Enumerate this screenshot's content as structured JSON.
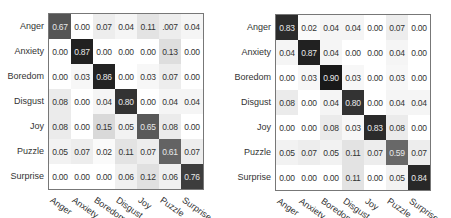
{
  "chart_data": [
    {
      "type": "heatmap",
      "title": "",
      "rows": [
        "Anger",
        "Anxiety",
        "Boredom",
        "Disgust",
        "Joy",
        "Puzzle",
        "Surprise"
      ],
      "cols": [
        "Anger",
        "Anxiety",
        "Boredom",
        "Disgust",
        "Joy",
        "Puzzle",
        "Surprise"
      ],
      "values": [
        [
          "0.67",
          "0.00",
          "0.07",
          "0.04",
          "0.11",
          ".007",
          "0.04"
        ],
        [
          "0.00",
          "0.87",
          "0.00",
          "0.00",
          "0.00",
          "0.13",
          "0.00"
        ],
        [
          "0.00",
          "0.03",
          "0.86",
          "0.00",
          "0.03",
          "0.07",
          "0.00"
        ],
        [
          "0.08",
          "0.00",
          "0.04",
          "0.80",
          "0.00",
          "0.04",
          "0.04"
        ],
        [
          "0.08",
          "0.00",
          "0.15",
          "0.05",
          "0.65",
          "0.08",
          "0.00"
        ],
        [
          "0.05",
          "0.07",
          "0.02",
          "0.11",
          "0.07",
          "0.61",
          "0.07"
        ],
        [
          "0.00",
          "0.00",
          "0.00",
          "0.06",
          "0.12",
          "0.06",
          "0.76"
        ]
      ]
    },
    {
      "type": "heatmap",
      "title": "",
      "rows": [
        "Anger",
        "Anxiety",
        "Boredom",
        "Disgust",
        "Joy",
        "Puzzle",
        "Surprise"
      ],
      "cols": [
        "Anger",
        "Anxiety",
        "Boredom",
        "Disgust",
        "Joy",
        "Puzzle",
        "Surprise"
      ],
      "values": [
        [
          "0.83",
          "0.02",
          "0.04",
          "0.04",
          "0.00",
          "0.07",
          "0.00"
        ],
        [
          "0.04",
          "0.87",
          "0.04",
          "0.00",
          "0.00",
          "0.04",
          "0.00"
        ],
        [
          "0.00",
          "0.03",
          "0.90",
          "0.03",
          "0.00",
          "0.03",
          "0.00"
        ],
        [
          "0.08",
          "0.00",
          "0.04",
          "0.80",
          "0.00",
          "0.04",
          "0.04"
        ],
        [
          "0.00",
          "0.00",
          "0.08",
          "0.03",
          "0.83",
          "0.08",
          "0.00"
        ],
        [
          "0.05",
          "0.07",
          "0.05",
          "0.11",
          "0.07",
          "0.59",
          "0.07"
        ],
        [
          "0.00",
          "0.00",
          "0.00",
          "0.11",
          "0.00",
          "0.05",
          "0.84"
        ]
      ]
    }
  ],
  "layout": {
    "panels": [
      {
        "matrix_left": 48,
        "matrix_top": 13
      },
      {
        "matrix_left": 275,
        "matrix_top": 14
      }
    ]
  }
}
